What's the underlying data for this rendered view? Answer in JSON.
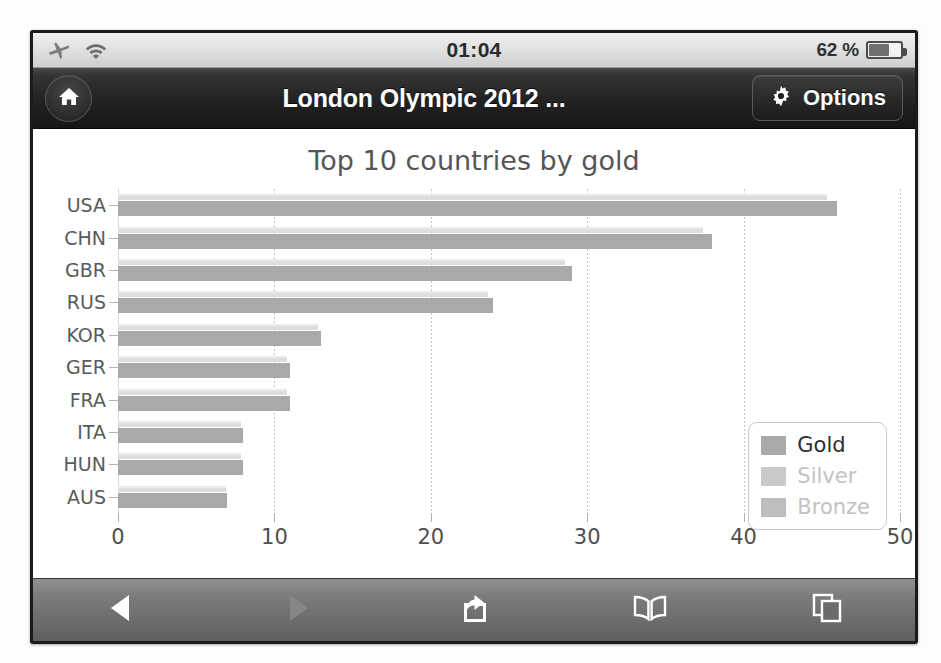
{
  "statusbar": {
    "airplane_icon": "airplane-icon",
    "wifi_icon": "wifi-icon",
    "clock": "01:04",
    "battery_percent": "62 %",
    "battery_icon": "battery-icon",
    "battery_level": 62
  },
  "navbar": {
    "home_icon": "home-icon",
    "title": "London Olympic 2012 ...",
    "options_label": "Options",
    "gear_icon": "gear-icon"
  },
  "toolbar": {
    "back_icon": "back-arrow-icon",
    "forward_icon": "forward-arrow-icon",
    "share_icon": "share-icon",
    "bookmarks_icon": "bookmarks-book-icon",
    "tabs_icon": "tabs-pages-icon"
  },
  "legend": {
    "items": [
      {
        "label": "Gold",
        "swatch": "#a9a9a9",
        "text_color": "#2e2e2e",
        "active": true
      },
      {
        "label": "Silver",
        "swatch": "#c9c9c9",
        "text_color": "#c2c2c2",
        "active": false
      },
      {
        "label": "Bronze",
        "swatch": "#bdbdbd",
        "text_color": "#c2c2c2",
        "active": false
      }
    ]
  },
  "chart_data": {
    "type": "bar",
    "orientation": "horizontal",
    "title": "Top 10 countries by gold",
    "xlabel": "",
    "ylabel": "",
    "categories": [
      "USA",
      "CHN",
      "GBR",
      "RUS",
      "KOR",
      "GER",
      "FRA",
      "ITA",
      "HUN",
      "AUS"
    ],
    "series": [
      {
        "name": "Gold",
        "color": "#a9a9a9",
        "values": [
          46,
          38,
          29,
          24,
          13,
          11,
          11,
          8,
          8,
          7
        ]
      },
      {
        "name": "Silver",
        "color": "#dddddd",
        "values": [
          0,
          0,
          0,
          0,
          0,
          0,
          0,
          0,
          0,
          0
        ]
      },
      {
        "name": "Bronze",
        "color": "#eaeaea",
        "values": [
          0,
          0,
          0,
          0,
          0,
          0,
          0,
          0,
          0,
          0
        ]
      }
    ],
    "xlim": [
      0,
      50
    ],
    "xticks": [
      0,
      10,
      20,
      30,
      40,
      50
    ],
    "xticklabels": [
      "0",
      "10",
      "20",
      "30",
      "40",
      "50"
    ],
    "grid": true,
    "legend_position": "lower right"
  }
}
